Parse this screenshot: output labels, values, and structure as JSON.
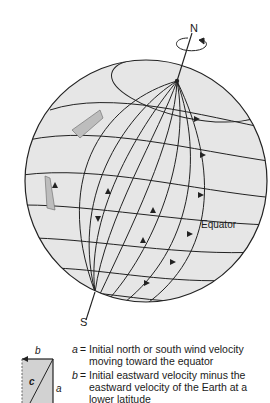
{
  "diagram": {
    "labels": {
      "north": "N",
      "south": "S",
      "equator": "Equator"
    },
    "vector_box": {
      "label_a": "a",
      "label_b": "b",
      "label_c": "c"
    },
    "legend": [
      {
        "key": "a",
        "eq": "=",
        "text": "Initial north or south wind velocity moving toward the equator"
      },
      {
        "key": "b",
        "eq": "=",
        "text": "Initial eastward velocity minus the eastward velocity of the Earth at a lower latitude"
      }
    ],
    "colors": {
      "sphere_fill": "#e6e6e6",
      "line": "#222222",
      "shade": "#bdbdbd"
    }
  }
}
